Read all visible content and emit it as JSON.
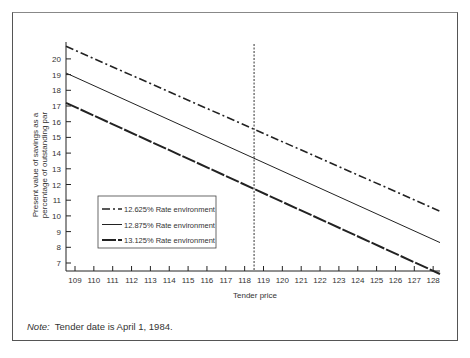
{
  "note": {
    "label": "Note:",
    "text": "Tender date is April 1, 1984."
  },
  "chart_data": {
    "type": "line",
    "title": "",
    "xlabel": "Tender price",
    "ylabel": "Present value of savings as a percentage of outstanding par",
    "x_ticks": [
      109,
      110,
      111,
      112,
      113,
      114,
      115,
      116,
      117,
      118,
      119,
      120,
      121,
      122,
      123,
      124,
      125,
      126,
      127,
      128
    ],
    "y_ticks": [
      7,
      8,
      9,
      10,
      11,
      12,
      13,
      14,
      15,
      16,
      17,
      18,
      19,
      20
    ],
    "xlim": [
      108.5,
      128.3
    ],
    "ylim": [
      6.2,
      21
    ],
    "grid": false,
    "legend_position": "lower-left inside",
    "annotations": [
      {
        "type": "vertical-dotted-line",
        "x": 118.5
      }
    ],
    "series": [
      {
        "name": "12.625% Rate environment",
        "style": "dash-dot",
        "x": [
          108.5,
          128.3
        ],
        "values": [
          20.8,
          10.3
        ]
      },
      {
        "name": "12.875% Rate environment",
        "style": "solid",
        "x": [
          108.5,
          128.3
        ],
        "values": [
          19.1,
          8.3
        ]
      },
      {
        "name": "13.125% Rate environment",
        "style": "bold-dashed",
        "x": [
          108.5,
          128.3
        ],
        "values": [
          17.2,
          6.3
        ]
      }
    ]
  }
}
